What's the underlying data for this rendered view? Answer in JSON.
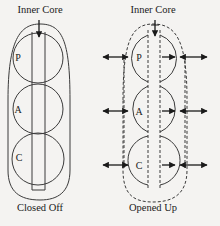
{
  "diagram": {
    "left": {
      "title": "Inner Core",
      "caption": "Closed Off",
      "segments": [
        "P",
        "A",
        "C"
      ]
    },
    "right": {
      "title": "Inner Core",
      "caption": "Opened Up",
      "segments": [
        "P",
        "A",
        "C"
      ]
    },
    "colors": {
      "line": "#3a3a3a",
      "background": "#f4f3f1"
    }
  }
}
